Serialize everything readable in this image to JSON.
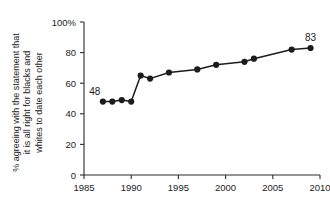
{
  "chart_data": {
    "type": "line",
    "title": "",
    "subtitle": "",
    "xlabel": "",
    "ylabel": "% agreeing with the statement that it is all right for blacks and whites to date each other",
    "ylabel_lines": [
      "% agreeing with the statement that",
      "it is all right for blacks and",
      "whites to date each other"
    ],
    "x": [
      1987,
      1988,
      1989,
      1990,
      1991,
      1992,
      1994,
      1997,
      1999,
      2002,
      2003,
      2007,
      2009
    ],
    "values": [
      48,
      48,
      49,
      48,
      65,
      63,
      67,
      69,
      72,
      74,
      76,
      82,
      83
    ],
    "series": [
      {
        "name": "% agreeing",
        "x": [
          1987,
          1988,
          1989,
          1990,
          1991,
          1992,
          1994,
          1997,
          1999,
          2002,
          2003,
          2007,
          2009
        ],
        "values": [
          48,
          48,
          49,
          48,
          65,
          63,
          67,
          69,
          72,
          74,
          76,
          82,
          83
        ]
      }
    ],
    "xlim": [
      1985,
      2010
    ],
    "ylim": [
      0,
      100
    ],
    "xticks": [
      1985,
      1990,
      1995,
      2000,
      2005,
      2010
    ],
    "xticklabels": [
      "1985",
      "1990",
      "1995",
      "2000",
      "2005",
      "2010"
    ],
    "yticks": [
      0,
      20,
      40,
      60,
      80,
      100
    ],
    "yticklabels": [
      "0",
      "20",
      "40",
      "60",
      "80",
      "100%"
    ],
    "annotations": [
      {
        "text": "48",
        "x": 1987,
        "y": 48,
        "position": "above-left"
      },
      {
        "text": "83",
        "x": 2009,
        "y": 83,
        "position": "above"
      }
    ],
    "grid": false,
    "legend": false,
    "legend_position": "none",
    "colors": {
      "line": "#1c1c1c",
      "marker": "#1c1c1c",
      "axis": "#2b2b2b",
      "text": "#1c1c1c",
      "background": "#ffffff"
    }
  }
}
